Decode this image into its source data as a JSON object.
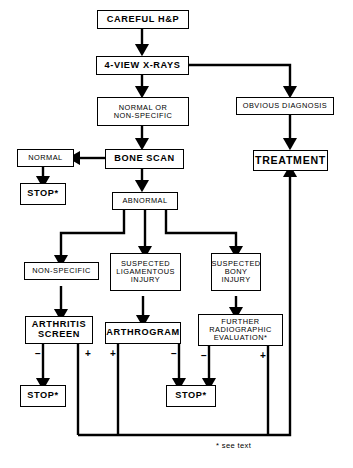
{
  "diagram": {
    "footnote": "* see text",
    "nodes": {
      "careful_hp": "CAREFUL H&P",
      "four_view_xrays": "4-VIEW X-RAYS",
      "normal_or_nonspecific": "NORMAL OR\nNON-SPECIFIC",
      "obvious_diagnosis": "OBVIOUS DIAGNOSIS",
      "treatment": "TREATMENT",
      "normal": "NORMAL",
      "bone_scan": "BONE SCAN",
      "stop_normal": "STOP*",
      "abnormal": "ABNORMAL",
      "non_specific": "NON-SPECIFIC",
      "suspected_ligamentous_injury": "SUSPECTED\nLIGAMENTOUS\nINJURY",
      "suspected_bony_injury": "SUSPECTED\nBONY\nINJURY",
      "arthritis_screen": "ARTHRITIS\nSCREEN",
      "arthrogram": "ARTHROGRAM",
      "further_radiographic_evaluation": "FURTHER\nRADIOGRAPHIC\nEVALUATION*",
      "stop_arthritis": "STOP*",
      "stop_arthrogram": "STOP*"
    },
    "edge_labels": {
      "arthritis_minus": "−",
      "arthritis_plus": "+",
      "arthrogram_plus": "+",
      "arthrogram_minus": "−",
      "further_minus": "−",
      "further_plus": "+"
    },
    "colors": {
      "stroke": "#000000",
      "background": "#ffffff"
    }
  }
}
